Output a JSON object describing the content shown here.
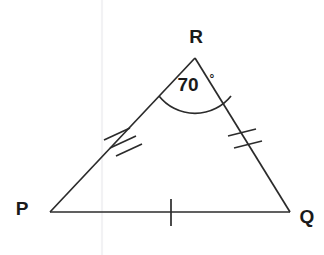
{
  "figure": {
    "kind": "geometry-diagram",
    "shape": "triangle",
    "name": "Triangle PQR",
    "background_color": "#ffffff",
    "stroke_color": "#2b2b2b",
    "label_color": "#1a1a1a",
    "canvas": {
      "width": 324,
      "height": 255
    }
  },
  "vertices": [
    {
      "id": "P",
      "label": "P",
      "x": 50,
      "y": 212,
      "label_x": 22,
      "label_y": 210
    },
    {
      "id": "Q",
      "label": "Q",
      "x": 290,
      "y": 212,
      "label_x": 307,
      "label_y": 218
    },
    {
      "id": "R",
      "label": "R",
      "x": 195,
      "y": 58,
      "label_x": 196,
      "label_y": 38
    }
  ],
  "sides": [
    {
      "id": "PR",
      "from": "P",
      "to": "R",
      "tick_count": 3,
      "tick_label": "triple-hash",
      "congruence_group": "long"
    },
    {
      "id": "RQ",
      "from": "R",
      "to": "Q",
      "tick_count": 2,
      "tick_label": "double-hash",
      "congruence_group": "medium"
    },
    {
      "id": "PQ",
      "from": "P",
      "to": "Q",
      "tick_count": 1,
      "tick_label": "single-hash",
      "congruence_group": "base"
    }
  ],
  "angles": [
    {
      "id": "R",
      "at_vertex": "R",
      "value": "70",
      "degree_symbol": "°",
      "full_label": "70°",
      "measure_degrees": 70,
      "marker": "arc",
      "label_x": 188,
      "label_y": 86,
      "degree_x": 212,
      "degree_y": 80
    }
  ]
}
